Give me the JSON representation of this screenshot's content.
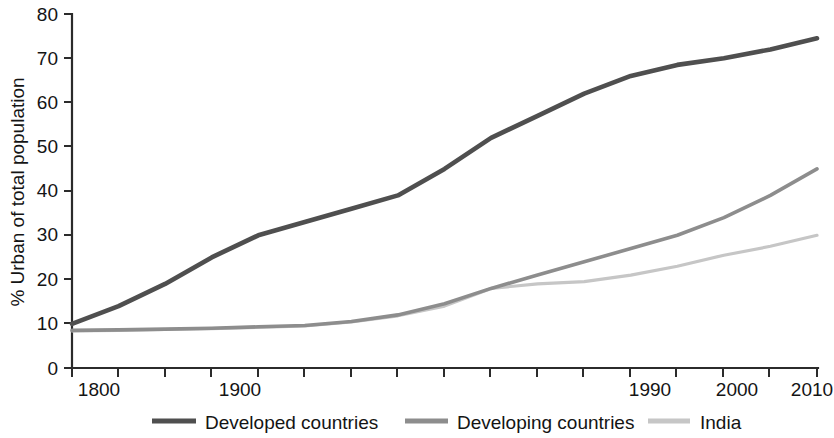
{
  "chart_data": {
    "type": "line",
    "title": "",
    "subtitle": "",
    "xlabel": "",
    "ylabel": "% Urban of total population",
    "ylim": [
      0,
      80
    ],
    "yticks": [
      0,
      10,
      20,
      30,
      40,
      50,
      60,
      70,
      80
    ],
    "ytick_labels": [
      "0",
      "10",
      "20",
      "30",
      "40",
      "50",
      "60",
      "70",
      "80"
    ],
    "grid": false,
    "legend_position": "bottom",
    "x_axis_note": "Non-uniform categorical axis: evenly spaced ticks, only some labeled",
    "x_tick_positions": [
      1800,
      1825,
      1850,
      1875,
      1900,
      1925,
      1950,
      1960,
      1970,
      1975,
      1980,
      1985,
      1990,
      1995,
      2000,
      2005,
      2010
    ],
    "x_tick_labels": [
      "1800",
      "",
      "",
      "",
      "1900",
      "",
      "",
      "",
      "",
      "",
      "",
      "",
      "1990",
      "",
      "2000",
      "",
      "2010"
    ],
    "labeled_ticks": [
      "1800",
      "1900",
      "1990",
      "2000",
      "2010"
    ],
    "categories": [
      "1800",
      "1825",
      "1850",
      "1875",
      "1900",
      "1925",
      "1950",
      "1960",
      "1970",
      "1975",
      "1980",
      "1985",
      "1990",
      "1995",
      "2000",
      "2005",
      "2010"
    ],
    "series": [
      {
        "name": "Developed countries",
        "color": "#4f4f4f",
        "values": [
          10,
          14,
          19,
          25,
          30,
          33,
          36,
          39,
          45,
          52,
          57,
          62,
          66,
          68.5,
          70,
          72,
          74.5
        ]
      },
      {
        "name": "Developing countries",
        "color": "#8d8d8d",
        "values": [
          8.5,
          8.6,
          8.8,
          9,
          9.3,
          9.6,
          10.5,
          12,
          14.5,
          18,
          21,
          24,
          27,
          30,
          34,
          39,
          45
        ]
      },
      {
        "name": "India",
        "color": "#c6c6c6",
        "values": [
          8.4,
          8.5,
          8.7,
          8.9,
          9.2,
          9.5,
          10.4,
          11.8,
          14,
          18,
          19,
          19.5,
          21,
          23,
          25.5,
          27.5,
          30
        ]
      }
    ]
  },
  "axis": {
    "y_title": "% Urban of total population",
    "y_ticks": [
      "80",
      "70",
      "60",
      "50",
      "40",
      "30",
      "20",
      "10",
      "0"
    ],
    "x_ticks": [
      "1800",
      "1900",
      "1990",
      "2000",
      "2010"
    ]
  },
  "legend": {
    "items": [
      {
        "label": "Developed countries",
        "color": "#4f4f4f"
      },
      {
        "label": "Developing countries",
        "color": "#8d8d8d"
      },
      {
        "label": "India",
        "color": "#c6c6c6"
      }
    ]
  },
  "colors": {
    "developed": "#4f4f4f",
    "developing": "#8d8d8d",
    "india": "#c6c6c6",
    "axis": "#2b2b2b",
    "text": "#141414",
    "background": "#ffffff"
  }
}
